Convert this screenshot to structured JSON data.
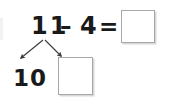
{
  "problem": {
    "minuend": "11",
    "minus_operator": "–",
    "subtrahend": "4",
    "equals_operator": "=",
    "sum_box_value": "",
    "sum_box_placeholder": ""
  },
  "decomposition": {
    "left_part_label": "10",
    "right_part_value": "",
    "right_part_placeholder": "",
    "arrow_count": 2
  },
  "colors": {
    "ink": "#1a1a1a",
    "box_border": "#a8a8a8",
    "box_shadow": "#d8d8d8",
    "arrow": "#3a3a3a",
    "background": "#ffffff"
  }
}
